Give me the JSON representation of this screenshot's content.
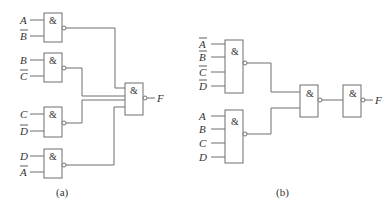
{
  "gate_symbol": "&",
  "circuit_a": {
    "caption": "(a)",
    "gates": [
      {
        "inputs": [
          {
            "name": "A",
            "negated": false
          },
          {
            "name": "B",
            "negated": true
          }
        ]
      },
      {
        "inputs": [
          {
            "name": "B",
            "negated": false
          },
          {
            "name": "C",
            "negated": true
          }
        ]
      },
      {
        "inputs": [
          {
            "name": "C",
            "negated": false
          },
          {
            "name": "D",
            "negated": true
          }
        ]
      },
      {
        "inputs": [
          {
            "name": "D",
            "negated": false
          },
          {
            "name": "A",
            "negated": true
          }
        ]
      }
    ],
    "output": "F"
  },
  "circuit_b": {
    "caption": "(b)",
    "gates": [
      {
        "inputs": [
          {
            "name": "A",
            "negated": true
          },
          {
            "name": "B",
            "negated": true
          },
          {
            "name": "C",
            "negated": true
          },
          {
            "name": "D",
            "negated": true
          }
        ]
      },
      {
        "inputs": [
          {
            "name": "A",
            "negated": false
          },
          {
            "name": "B",
            "negated": false
          },
          {
            "name": "C",
            "negated": false
          },
          {
            "name": "D",
            "negated": false
          }
        ]
      }
    ],
    "output": "F"
  }
}
